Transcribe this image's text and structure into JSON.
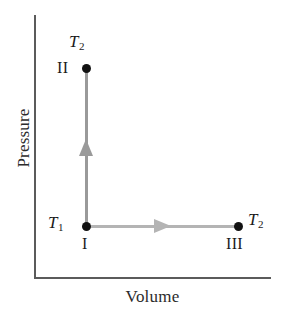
{
  "figure": {
    "name": "pressure-volume-diagram",
    "axes": {
      "x_label": "Volume",
      "y_label": "Pressure"
    },
    "colors": {
      "axis": "#5b5b5b",
      "path_vertical": "#9a9a9a",
      "path_horizontal": "#b4b4b4",
      "point": "#121212",
      "text": "#1a1a1a",
      "background": "#ffffff"
    },
    "states": [
      {
        "id": "I",
        "roman_label": "I",
        "temperature_label": "T",
        "temperature_subscript": "1",
        "label_position": "left",
        "roman_position": "below"
      },
      {
        "id": "II",
        "roman_label": "II",
        "temperature_label": "T",
        "temperature_subscript": "2",
        "label_position": "above",
        "roman_position": "left"
      },
      {
        "id": "III",
        "roman_label": "III",
        "temperature_label": "T",
        "temperature_subscript": "2",
        "label_position": "right",
        "roman_position": "below"
      }
    ],
    "processes": [
      {
        "name": "isochoric-heating",
        "from": "I",
        "to": "II",
        "direction": "up"
      },
      {
        "name": "isobaric-expansion",
        "from": "I",
        "to": "III",
        "direction": "right"
      }
    ]
  },
  "chart_data": {
    "type": "line",
    "title": "",
    "xlabel": "Volume",
    "ylabel": "Pressure",
    "grid": false,
    "legend": "none",
    "xlim": [
      0,
      1
    ],
    "ylim": [
      0,
      1
    ],
    "annotations": [
      "T",
      "1",
      "T",
      "2",
      "I",
      "II",
      "III"
    ],
    "series": [
      {
        "name": "I to II (constant volume)",
        "x": [
          0.22,
          0.22
        ],
        "y": [
          0.2,
          0.8
        ],
        "arrow": "up",
        "color": "#9a9a9a"
      },
      {
        "name": "I to III (constant pressure)",
        "x": [
          0.22,
          0.86
        ],
        "y": [
          0.2,
          0.2
        ],
        "arrow": "right",
        "color": "#b4b4b4"
      }
    ],
    "points": [
      {
        "label": "I",
        "x": 0.22,
        "y": 0.2,
        "temperature": "T1"
      },
      {
        "label": "II",
        "x": 0.22,
        "y": 0.8,
        "temperature": "T2"
      },
      {
        "label": "III",
        "x": 0.86,
        "y": 0.2,
        "temperature": "T2"
      }
    ]
  }
}
